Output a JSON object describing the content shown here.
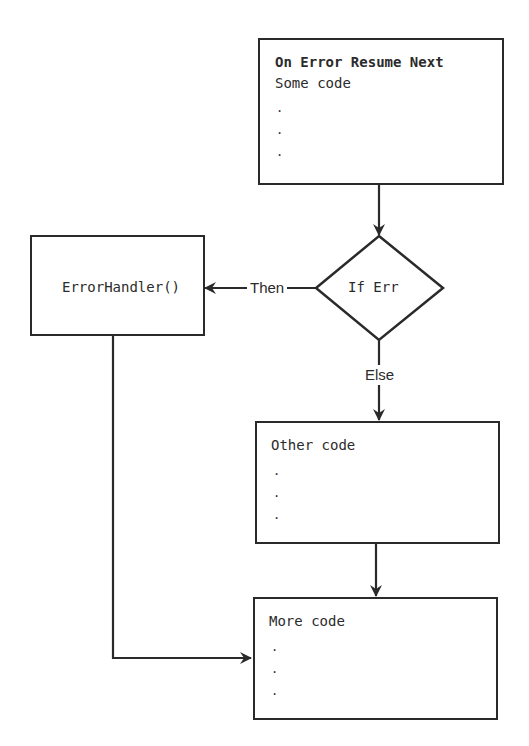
{
  "diagram": {
    "type": "flowchart",
    "colors": {
      "stroke": "#2a2a2a",
      "text": "#2b2b2b",
      "background": "#ffffff"
    },
    "nodes": {
      "start": {
        "title": "On Error Resume Next",
        "lines": [
          "Some code",
          ".",
          ".",
          "."
        ]
      },
      "decision": {
        "label": "If Err"
      },
      "handler": {
        "label": "ErrorHandler()"
      },
      "other": {
        "lines": [
          "Other code",
          ".",
          ".",
          "."
        ]
      },
      "more": {
        "lines": [
          "More code",
          ".",
          ".",
          "."
        ]
      }
    },
    "edges": {
      "then_label": "Then",
      "else_label": "Else"
    }
  }
}
